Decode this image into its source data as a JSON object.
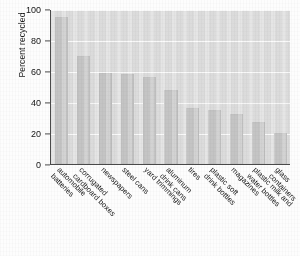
{
  "chart_data": {
    "type": "bar",
    "title": "",
    "xlabel": "",
    "ylabel": "Percent recycled",
    "ylim": [
      0,
      100
    ],
    "yticks": [
      0,
      20,
      40,
      60,
      80,
      100
    ],
    "grid": "horizontal",
    "legend": "none",
    "bar_color": "#c6c6c6",
    "plot_background": "#dedede",
    "categories": [
      "automobile batteries",
      "corrugated cardboard boxes",
      "newspapers",
      "steel cans",
      "yard trimmings",
      "aluminum drink cans",
      "tires",
      "plastic soft drink bottles",
      "magazines",
      "plastic milk and water bottles",
      "glass containers"
    ],
    "category_lines": [
      [
        "automobile",
        "batteries"
      ],
      [
        "corrugated",
        "cardboard boxes"
      ],
      [
        "newspapers",
        ""
      ],
      [
        "steel cans",
        ""
      ],
      [
        "yard trimmings",
        ""
      ],
      [
        "aluminum",
        "drink cans"
      ],
      [
        "tires",
        ""
      ],
      [
        "plastic soft",
        "drink bottles"
      ],
      [
        "magazines",
        ""
      ],
      [
        "plastic milk and",
        "water bottles"
      ],
      [
        "glass",
        "containers"
      ]
    ],
    "values": [
      95,
      70,
      59,
      58,
      56,
      48,
      36,
      35,
      32,
      27,
      20
    ]
  }
}
